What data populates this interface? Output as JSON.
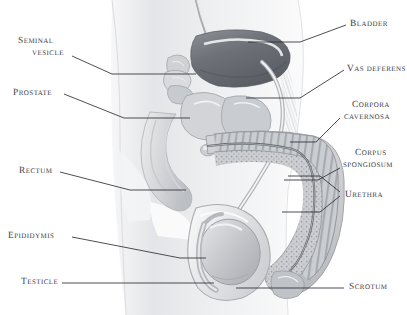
{
  "figure": {
    "background_color": "#ffffff",
    "label_color": "#3b3b44",
    "leader_color": "#2e2e38",
    "body_fill": "#e9eaec",
    "organ_dark": "#6f7278",
    "organ_mid": "#b9bcc1",
    "organ_light": "#d6d8db"
  },
  "labels": {
    "seminal_vesicle": {
      "line1": "Seminal",
      "line2": "vesicle"
    },
    "prostate": {
      "line1": "Prostate"
    },
    "rectum": {
      "line1": "Rectum"
    },
    "epididymis": {
      "line1": "Epididymis"
    },
    "testicle": {
      "line1": "Testicle"
    },
    "bladder": {
      "line1": "Bladder"
    },
    "vas_deferens": {
      "line1": "Vas deferens"
    },
    "corpora_cavernosa": {
      "line1": "Corpora",
      "line2": "cavernosa"
    },
    "corpus_spongiosum": {
      "line1": "Corpus",
      "line2": "spongiosum"
    },
    "urethra": {
      "line1": "Urethra"
    },
    "scrotum": {
      "line1": "Scrotum"
    }
  }
}
